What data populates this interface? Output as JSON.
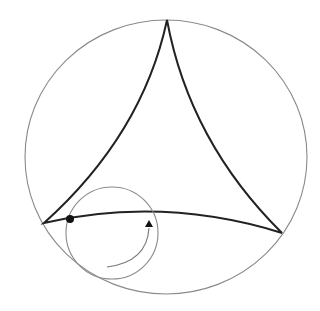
{
  "diagram": {
    "type": "deltoid-hypocycloid",
    "colors": {
      "background": "#ffffff",
      "outer_circle": "#8a8a8a",
      "deltoid": "#222222",
      "rolling_circle": "#8a8a8a",
      "arrow": "#777777",
      "tracing_point": "#111111"
    },
    "outer_circle": {
      "cx": 166,
      "cy": 157,
      "rx": 141,
      "ry": 137
    },
    "cusps": [
      {
        "name": "top",
        "x": 167,
        "y": 20
      },
      {
        "name": "left",
        "x": 44,
        "y": 223
      },
      {
        "name": "right",
        "x": 282,
        "y": 233
      }
    ],
    "rolling_circle": {
      "cx": 112,
      "cy": 233,
      "r": 46
    },
    "tracing_point": {
      "x": 70,
      "y": 219,
      "r": 4
    },
    "rotation_arrow": {
      "direction": "counterclockwise",
      "start": [
        107,
        267
      ],
      "end": [
        149,
        222
      ]
    }
  }
}
